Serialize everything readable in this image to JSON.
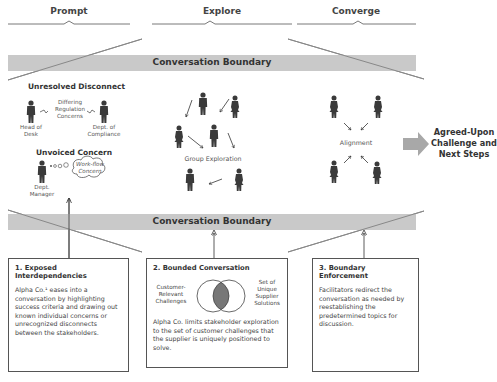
{
  "phases": [
    {
      "label": "Prompt"
    },
    {
      "label": "Explore"
    },
    {
      "label": "Converge"
    }
  ],
  "boundary": {
    "top_label": "Conversation Boundary",
    "bottom_label": "Conversation Boundary",
    "bar_color": "#c9c9c9"
  },
  "prompt": {
    "disconnect_heading": "Unresolved Disconnect",
    "disconnect_note": [
      "Differing",
      "Regulation",
      "Concerns"
    ],
    "person_left": [
      "Head of",
      "Desk"
    ],
    "person_right": [
      "Dept. of",
      "Compliance"
    ],
    "unvoiced_heading": "Unvoiced Concern",
    "manager": [
      "Dept.",
      "Manager"
    ],
    "thought_bubble": [
      "Work-flow",
      "Concern"
    ]
  },
  "explore": {
    "label": "Group Exploration"
  },
  "converge": {
    "label": "Alignment"
  },
  "result": {
    "lines": [
      "Agreed-Upon",
      "Challenge and",
      "Next Steps"
    ],
    "arrow_color": "#a8a8a8"
  },
  "boxes": [
    {
      "title": "1. Exposed Interdependencies",
      "body": "Alpha Co.¹ eases into a conversation by highlighting success criteria and drawing out known individual concerns or unrecognized disconnects between the stakeholders."
    },
    {
      "title": "2. Bounded Conversation",
      "venn_left": [
        "Customer-",
        "Relevant",
        "Challenges"
      ],
      "venn_right": [
        "Set of",
        "Unique",
        "Supplier",
        "Solutions"
      ],
      "body": "Alpha Co. limits stakeholder exploration to the set of customer challenges that the supplier is uniquely positioned to solve."
    },
    {
      "title": "3. Boundary Enforcement",
      "body": "Facilitators redirect the conversation as needed by reestablishing the predetermined topics for discussion."
    }
  ]
}
